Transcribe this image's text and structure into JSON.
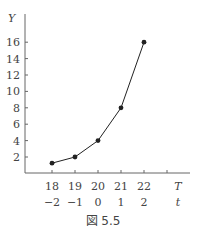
{
  "chart_data": {
    "type": "line",
    "title": "",
    "caption": "図 5.5",
    "xlabel": "T",
    "xlabel_secondary": "t",
    "ylabel": "Y",
    "x": [
      18,
      19,
      20,
      21,
      22
    ],
    "x_secondary": [
      -2,
      -1,
      0,
      1,
      2
    ],
    "x_tick_labels": [
      "18",
      "19",
      "20",
      "21",
      "22"
    ],
    "x_secondary_tick_labels": [
      "−2",
      "−1",
      "0",
      "1",
      "2"
    ],
    "y_ticks": [
      2,
      4,
      6,
      8,
      10,
      12,
      14,
      16
    ],
    "y_tick_labels": [
      "2",
      "4",
      "6",
      "8",
      "10",
      "12",
      "14",
      "16"
    ],
    "series": [
      {
        "name": "Y",
        "values": [
          1.25,
          2,
          4,
          8,
          16
        ],
        "marker": "circle",
        "color": "#222222"
      }
    ],
    "xlim": [
      16.8,
      23.5
    ],
    "ylim": [
      0,
      18
    ],
    "grid": false,
    "legend": null
  },
  "caption_label": "図 5.5"
}
